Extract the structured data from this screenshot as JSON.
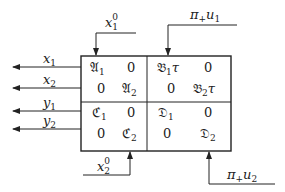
{
  "diagram": {
    "type": "block-diagram",
    "colors": {
      "stroke": "#222222",
      "background": "#ffffff"
    },
    "box": {
      "matrix": [
        [
          {
            "sym": "𝔄",
            "sub": "1",
            "suf": ""
          },
          {
            "sym": "0",
            "sub": "",
            "suf": ""
          },
          {
            "sym": "𝔅",
            "sub": "1",
            "suf": "τ"
          },
          {
            "sym": "0",
            "sub": "",
            "suf": ""
          }
        ],
        [
          {
            "sym": "0",
            "sub": "",
            "suf": ""
          },
          {
            "sym": "𝔄",
            "sub": "2",
            "suf": ""
          },
          {
            "sym": "0",
            "sub": "",
            "suf": ""
          },
          {
            "sym": "𝔅",
            "sub": "2",
            "suf": "τ"
          }
        ],
        [
          {
            "sym": "ℭ",
            "sub": "1",
            "suf": ""
          },
          {
            "sym": "0",
            "sub": "",
            "suf": ""
          },
          {
            "sym": "𝔇",
            "sub": "1",
            "suf": ""
          },
          {
            "sym": "0",
            "sub": "",
            "suf": ""
          }
        ],
        [
          {
            "sym": "0",
            "sub": "",
            "suf": ""
          },
          {
            "sym": "ℭ",
            "sub": "2",
            "suf": ""
          },
          {
            "sym": "0",
            "sub": "",
            "suf": ""
          },
          {
            "sym": "𝔇",
            "sub": "2",
            "suf": ""
          }
        ]
      ]
    },
    "inputs": {
      "x1_0": {
        "base": "x",
        "sub": "1",
        "sup": "0"
      },
      "pi_u1": {
        "pi": "π",
        "plus": "+",
        "var": "u",
        "sub": "1"
      },
      "x2_0": {
        "base": "x",
        "sub": "2",
        "sup": "0"
      },
      "pi_u2": {
        "pi": "π",
        "plus": "+",
        "var": "u",
        "sub": "2"
      }
    },
    "outputs": [
      {
        "base": "x",
        "sub": "1"
      },
      {
        "base": "x",
        "sub": "2"
      },
      {
        "base": "y",
        "sub": "1"
      },
      {
        "base": "y",
        "sub": "2"
      }
    ]
  }
}
